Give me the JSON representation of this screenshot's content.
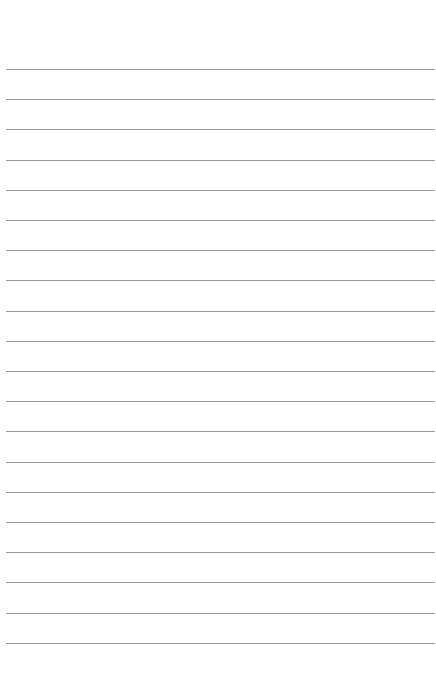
{
  "page": {
    "type": "lined-paper",
    "background_color": "#ffffff",
    "line_color": "#9a9a9a",
    "line_count": 20,
    "first_line_y": 69,
    "line_spacing": 30.2
  }
}
